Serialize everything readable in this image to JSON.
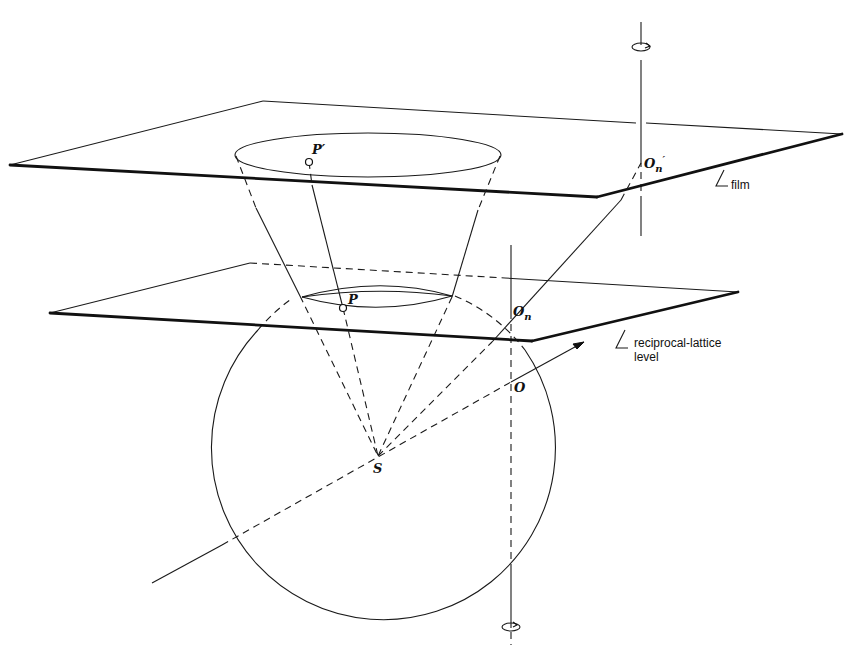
{
  "figure": {
    "labels": {
      "p_prime": "P′",
      "p": "P",
      "o_n_prime_main": "O",
      "o_n_prime_sub": "n",
      "o_n_prime_mark": "′",
      "o_n_main": "O",
      "o_n_sub": "n",
      "o": "O",
      "s": "S"
    },
    "annotations": {
      "film": "film",
      "reciprocal_lattice_line1": "reciprocal-lattice",
      "reciprocal_lattice_line2": "level"
    },
    "elements": [
      "film-plane",
      "reciprocal-lattice-level-plane",
      "sphere-of-reflection",
      "cone-of-diffracted-rays",
      "rotation-axis",
      "incident-beam-arrow",
      "rotation-direction-icon-top",
      "rotation-direction-icon-bottom"
    ]
  }
}
